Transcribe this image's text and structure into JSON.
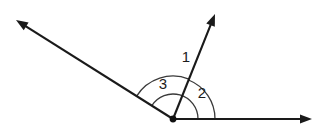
{
  "figure": {
    "background_color": "#ffffff",
    "line_color": "#1a1a1a",
    "arc_color": "#3a3a3a",
    "label_color": "#1c1c1c",
    "vertex": {
      "x": 173,
      "y": 119,
      "dot_radius": 3.4
    },
    "rays": [
      {
        "name": "ray-upper-left",
        "from_x": 173,
        "from_y": 119,
        "to_x": 16,
        "to_y": 20,
        "has_arrow": true,
        "direction_degrees": 147.8
      },
      {
        "name": "ray-upper-right",
        "from_x": 173,
        "from_y": 119,
        "to_x": 215,
        "to_y": 14,
        "has_arrow": true,
        "direction_degrees": 68.2
      },
      {
        "name": "ray-right-horizontal",
        "from_x": 173,
        "from_y": 119,
        "to_x": 312,
        "to_y": 119,
        "has_arrow": true,
        "direction_degrees": 0
      }
    ],
    "arcs": [
      {
        "name": "arc-angle-1",
        "label": "1",
        "radius": 43,
        "start_degrees": 68.2,
        "end_degrees": 147.8,
        "label_x": 186,
        "label_y": 58
      },
      {
        "name": "arc-angle-2",
        "label": "2",
        "radius": 42,
        "start_degrees": 0,
        "end_degrees": 68.2,
        "label_x": 202,
        "label_y": 94
      },
      {
        "name": "arc-angle-3",
        "label": "3",
        "radius": 25,
        "start_degrees": 0,
        "end_degrees": 147.8,
        "label_x": 163,
        "label_y": 85
      }
    ],
    "labels": [
      {
        "name": "angle-label-1",
        "text": "1"
      },
      {
        "name": "angle-label-2",
        "text": "2"
      },
      {
        "name": "angle-label-3",
        "text": "3"
      }
    ]
  }
}
